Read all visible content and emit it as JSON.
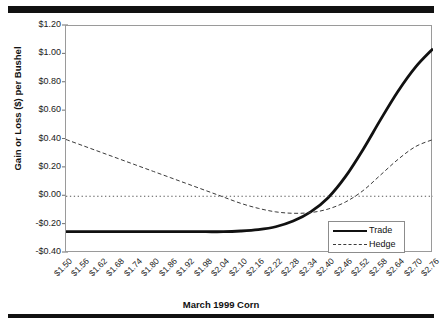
{
  "chart_data": {
    "type": "line",
    "title": "",
    "xlabel": "March 1999 Corn",
    "ylabel": "Gain or Loss ($) per Bushel",
    "grid": false,
    "legend_position": "bottom-right",
    "ylim": [
      -0.4,
      1.2
    ],
    "ytick_labels": [
      "$1.20",
      "$1.00",
      "$0.80",
      "$0.60",
      "$0.40",
      "$0.20",
      "$0.00",
      "-$0.20",
      "-$0.40"
    ],
    "ytick_values": [
      1.2,
      1.0,
      0.8,
      0.6,
      0.4,
      0.2,
      0.0,
      -0.2,
      -0.4
    ],
    "categories": [
      "$1.50",
      "$1.56",
      "$1.62",
      "$1.68",
      "$1.74",
      "$1.80",
      "$1.86",
      "$1.92",
      "$1.98",
      "$2.04",
      "$2.10",
      "$2.16",
      "$2.22",
      "$2.28",
      "$2.34",
      "$2.40",
      "$2.46",
      "$2.52",
      "$2.58",
      "$2.64",
      "$2.70",
      "$2.76"
    ],
    "x_values": [
      1.5,
      1.56,
      1.62,
      1.68,
      1.74,
      1.8,
      1.86,
      1.92,
      1.98,
      2.04,
      2.1,
      2.16,
      2.22,
      2.28,
      2.34,
      2.4,
      2.46,
      2.52,
      2.58,
      2.64,
      2.7,
      2.76
    ],
    "series": [
      {
        "name": "Trade",
        "style": "solid",
        "color": "#111111",
        "width": 2.8,
        "values": [
          -0.25,
          -0.25,
          -0.25,
          -0.25,
          -0.25,
          -0.25,
          -0.25,
          -0.25,
          -0.25,
          -0.25,
          -0.245,
          -0.235,
          -0.215,
          -0.175,
          -0.11,
          -0.01,
          0.14,
          0.33,
          0.54,
          0.74,
          0.91,
          1.04
        ]
      },
      {
        "name": "Hedge",
        "style": "dashed",
        "color": "#3a3a3a",
        "width": 1.0,
        "values": [
          0.4,
          0.355,
          0.31,
          0.265,
          0.22,
          0.175,
          0.13,
          0.085,
          0.04,
          -0.005,
          -0.05,
          -0.085,
          -0.11,
          -0.12,
          -0.115,
          -0.09,
          -0.04,
          0.04,
          0.15,
          0.26,
          0.35,
          0.4
        ]
      },
      {
        "name": "Zero Reference",
        "style": "dotted",
        "color": "#555555",
        "width": 1.0,
        "values": [
          0,
          0,
          0,
          0,
          0,
          0,
          0,
          0,
          0,
          0,
          0,
          0,
          0,
          0,
          0,
          0,
          0,
          0,
          0,
          0,
          0,
          0
        ]
      }
    ]
  },
  "legend": {
    "entries": [
      {
        "label": "Trade"
      },
      {
        "label": "Hedge"
      }
    ]
  }
}
